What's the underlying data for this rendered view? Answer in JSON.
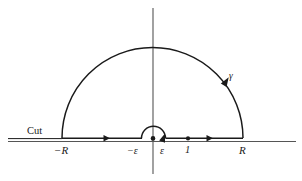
{
  "figure": {
    "kind": "complex-contour-integration-diagram",
    "colors": {
      "stroke": "#1a1a1a",
      "axis": "#555555",
      "background": "#ffffff"
    },
    "axes": {
      "real_axis_name": "real-axis",
      "imaginary_axis_name": "imaginary-axis"
    },
    "labels": {
      "cut": "Cut",
      "neg_R": "−R",
      "neg_epsilon": "−ε",
      "epsilon": "ε",
      "one": "1",
      "R": "R",
      "gamma": "γ"
    },
    "points": [
      {
        "name": "origin",
        "label": "",
        "x": 153,
        "y": 141
      },
      {
        "name": "one",
        "label": "1",
        "x": 188,
        "y": 141
      }
    ],
    "contour": {
      "big_arc": {
        "center_x": 152.5,
        "center_y": 138,
        "radius": 90.5,
        "from_deg": 180,
        "to_deg": 0
      },
      "small_arc": {
        "center_x": 153.5,
        "center_y": 138,
        "radius": 12,
        "from_deg": 180,
        "to_deg": 0
      },
      "segment_left": {
        "x1": 62,
        "x2": 141,
        "y": 138
      },
      "segment_right": {
        "x1": 166,
        "x2": 243,
        "y": 138
      },
      "arrow_left_x": 110,
      "arrow_right_x": 212,
      "arrow_arc_angle_deg": 32
    }
  }
}
